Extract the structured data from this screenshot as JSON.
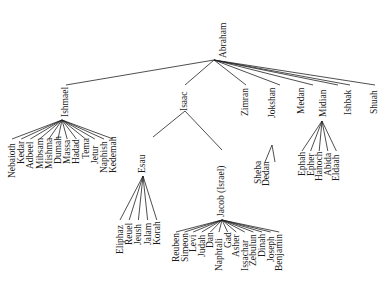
{
  "diagram": {
    "type": "family-tree",
    "root": {
      "name": "Abraham",
      "children": [
        {
          "name": "Ishmael",
          "children": [
            "Nebaioth",
            "Kedar",
            "Adbeel",
            "Mibsam",
            "Mishma",
            "Dumah",
            "Massa",
            "Hadad",
            "Tema",
            "Jetur",
            "Naphish",
            "Kedemah"
          ]
        },
        {
          "name": "Isaac",
          "children": [
            {
              "name": "Esau",
              "children": [
                "Eliphaz",
                "Reuel",
                "Jeush",
                "Jalam",
                "Korah"
              ]
            },
            {
              "name": "Jacob (Israel)",
              "children": [
                "Reuben",
                "Simeon",
                "Levi",
                "Judah",
                "Dan",
                "Naphtali",
                "Gad",
                "Asher",
                "Issachar",
                "Zebulun",
                "Dinah",
                "Joseph",
                "Benjamin"
              ]
            }
          ]
        },
        {
          "name": "Zimran",
          "children": []
        },
        {
          "name": "Jokshan",
          "children": [
            "Sheba",
            "Dedan"
          ]
        },
        {
          "name": "Medan",
          "children": []
        },
        {
          "name": "Midian",
          "children": [
            "Ephah",
            "Epher",
            "Hanoch",
            "Abida",
            "Eldaah"
          ]
        },
        {
          "name": "Ishbak",
          "children": []
        },
        {
          "name": "Shuah",
          "children": []
        }
      ]
    }
  },
  "labels": {
    "abraham": "Abraham",
    "ishmael": "Ishmael",
    "isaac": "Isaac",
    "zimran": "Zimran",
    "jokshan": "Jokshan",
    "medan": "Medan",
    "midian": "Midian",
    "ishbak": "Ishbak",
    "shuah": "Shuah",
    "esau": "Esau",
    "jacob": "Jacob (Israel)",
    "sheba": "Sheba",
    "dedan": "Dedan",
    "ishmael_sons": [
      "Nebaioth",
      "Kedar",
      "Adbeel",
      "Mibsam",
      "Mishma",
      "Dumah",
      "Massa",
      "Hadad",
      "Tema",
      "Jetur",
      "Naphish",
      "Kedemah"
    ],
    "esau_sons": [
      "Eliphaz",
      "Reuel",
      "Jeush",
      "Jalam",
      "Korah"
    ],
    "jacob_children": [
      "Reuben",
      "Simeon",
      "Levi",
      "Judah",
      "Dan",
      "Naphtali",
      "Gad",
      "Asher",
      "Issachar",
      "Zebulun",
      "Dinah",
      "Joseph",
      "Benjamin"
    ],
    "midian_sons": [
      "Ephah",
      "Epher",
      "Hanoch",
      "Abida",
      "Eldaah"
    ]
  }
}
